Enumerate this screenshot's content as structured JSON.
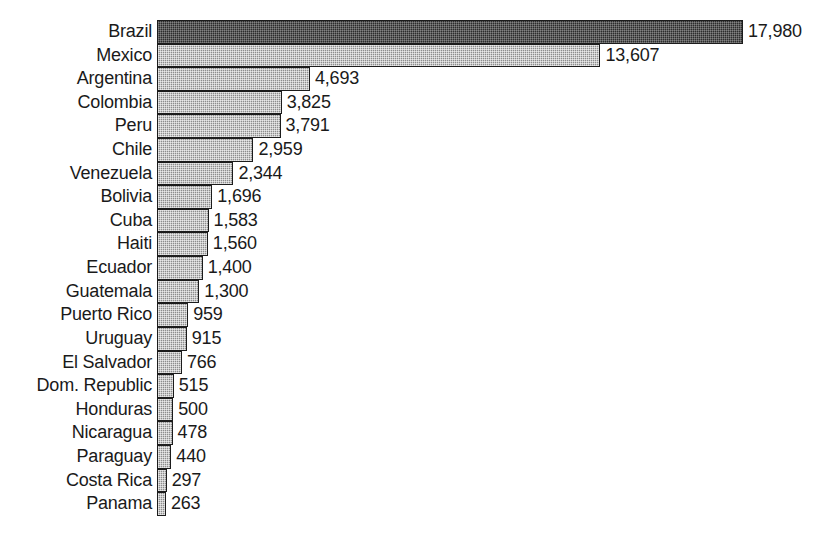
{
  "chart_data": {
    "type": "bar",
    "orientation": "horizontal",
    "title": "",
    "subtitle": "",
    "xlabel": "",
    "ylabel": "",
    "xlim": [
      0,
      17980
    ],
    "grid": false,
    "legend": null,
    "axis_line": false,
    "tick_labels": [],
    "value_label_format": "comma-separated integer",
    "sorted": "descending",
    "colors": {
      "bar_fill": "#a0a0a0",
      "bar_fill_highlight": "#3b3b3b",
      "bar_border": "#1c1c1c",
      "text": "#1a1a1a",
      "background": "#ffffff"
    },
    "categories": [
      "Brazil",
      "Mexico",
      "Argentina",
      "Colombia",
      "Peru",
      "Chile",
      "Venezuela",
      "Bolivia",
      "Cuba",
      "Haiti",
      "Ecuador",
      "Guatemala",
      "Puerto Rico",
      "Uruguay",
      "El Salvador",
      "Dom. Republic",
      "Honduras",
      "Nicaragua",
      "Paraguay",
      "Costa Rica",
      "Panama"
    ],
    "values": [
      17980,
      13607,
      4693,
      3825,
      3791,
      2959,
      2344,
      1696,
      1583,
      1560,
      1400,
      1300,
      959,
      915,
      766,
      515,
      500,
      478,
      440,
      297,
      263
    ],
    "value_labels": [
      "17,980",
      "13,607",
      "4,693",
      "3,825",
      "3,791",
      "2,959",
      "2,344",
      "1,696",
      "1,583",
      "1,560",
      "1,400",
      "1,300",
      "959",
      "915",
      "766",
      "515",
      "500",
      "478",
      "440",
      "297",
      "263"
    ],
    "bars": [
      {
        "category": "Brazil",
        "value": 17980,
        "label": "17,980",
        "highlight": true
      },
      {
        "category": "Mexico",
        "value": 13607,
        "label": "13,607",
        "highlight": false
      },
      {
        "category": "Argentina",
        "value": 4693,
        "label": "4,693",
        "highlight": false
      },
      {
        "category": "Colombia",
        "value": 3825,
        "label": "3,825",
        "highlight": false
      },
      {
        "category": "Peru",
        "value": 3791,
        "label": "3,791",
        "highlight": false
      },
      {
        "category": "Chile",
        "value": 2959,
        "label": "2,959",
        "highlight": false
      },
      {
        "category": "Venezuela",
        "value": 2344,
        "label": "2,344",
        "highlight": false
      },
      {
        "category": "Bolivia",
        "value": 1696,
        "label": "1,696",
        "highlight": false
      },
      {
        "category": "Cuba",
        "value": 1583,
        "label": "1,583",
        "highlight": false
      },
      {
        "category": "Haiti",
        "value": 1560,
        "label": "1,560",
        "highlight": false
      },
      {
        "category": "Ecuador",
        "value": 1400,
        "label": "1,400",
        "highlight": false
      },
      {
        "category": "Guatemala",
        "value": 1300,
        "label": "1,300",
        "highlight": false
      },
      {
        "category": "Puerto Rico",
        "value": 959,
        "label": "959",
        "highlight": false
      },
      {
        "category": "Uruguay",
        "value": 915,
        "label": "915",
        "highlight": false
      },
      {
        "category": "El Salvador",
        "value": 766,
        "label": "766",
        "highlight": false
      },
      {
        "category": "Dom. Republic",
        "value": 515,
        "label": "515",
        "highlight": false
      },
      {
        "category": "Honduras",
        "value": 500,
        "label": "500",
        "highlight": false
      },
      {
        "category": "Nicaragua",
        "value": 478,
        "label": "478",
        "highlight": false
      },
      {
        "category": "Paraguay",
        "value": 440,
        "label": "440",
        "highlight": false
      },
      {
        "category": "Costa Rica",
        "value": 297,
        "label": "297",
        "highlight": false
      },
      {
        "category": "Panama",
        "value": 263,
        "label": "263",
        "highlight": false
      }
    ]
  }
}
